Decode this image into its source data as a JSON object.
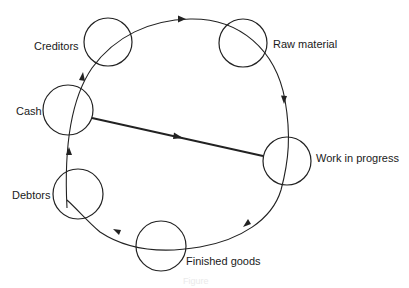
{
  "diagram": {
    "nodes": [
      {
        "id": "creditors",
        "label": "Creditors"
      },
      {
        "id": "raw_material",
        "label": "Raw material"
      },
      {
        "id": "work_in_progress",
        "label": "Work in progress"
      },
      {
        "id": "finished_goods",
        "label": "Finished goods"
      },
      {
        "id": "debtors",
        "label": "Debtors"
      },
      {
        "id": "cash",
        "label": "Cash"
      }
    ],
    "cycle_order": [
      "creditors",
      "raw_material",
      "work_in_progress",
      "finished_goods",
      "debtors",
      "cash",
      "creditors"
    ],
    "direct_flow": {
      "from": "cash",
      "to": "work_in_progress"
    },
    "caption": "Figure"
  }
}
